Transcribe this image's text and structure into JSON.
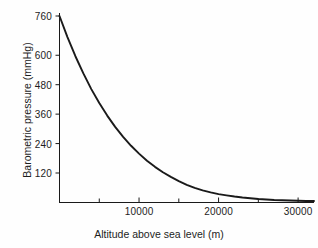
{
  "chart_data": {
    "type": "line",
    "title": "",
    "xlabel": "Altitude above sea level (m)",
    "ylabel": "Barometric pressure (mmHg)",
    "xlim": [
      0,
      32000
    ],
    "ylim": [
      0,
      760
    ],
    "grid": false,
    "legend": null,
    "xticks": [
      10000,
      20000,
      30000
    ],
    "xtick_labels": [
      "10000",
      "20000",
      "30000"
    ],
    "xminor_ticks": [
      5000,
      15000,
      25000
    ],
    "yticks": [
      120,
      240,
      360,
      480,
      600,
      760
    ],
    "ytick_labels": [
      "120",
      "240",
      "360",
      "480",
      "600",
      "760"
    ],
    "line_color": "#1a1a1a",
    "line_width": 1.9,
    "series": [
      {
        "name": "Barometric pressure",
        "x": [
          0,
          1000,
          2000,
          3000,
          4000,
          5000,
          6000,
          7000,
          8000,
          9000,
          10000,
          11000,
          12000,
          13000,
          14000,
          15000,
          16000,
          17000,
          18000,
          19000,
          20000,
          21000,
          22000,
          23000,
          24000,
          25000,
          26000,
          27000,
          28000,
          29000,
          30000,
          31000,
          32000
        ],
        "y": [
          760,
          674,
          596,
          526,
          462,
          405,
          354,
          308,
          267,
          231,
          199,
          170,
          145,
          123,
          104,
          87,
          72,
          59,
          49,
          41,
          34,
          29,
          24,
          20,
          17,
          14,
          12,
          10,
          9,
          8,
          7,
          6,
          6
        ]
      }
    ]
  },
  "axis": {
    "y_title": "Barometric pressure (mmHg)",
    "x_title": "Altitude above sea level (m)"
  }
}
